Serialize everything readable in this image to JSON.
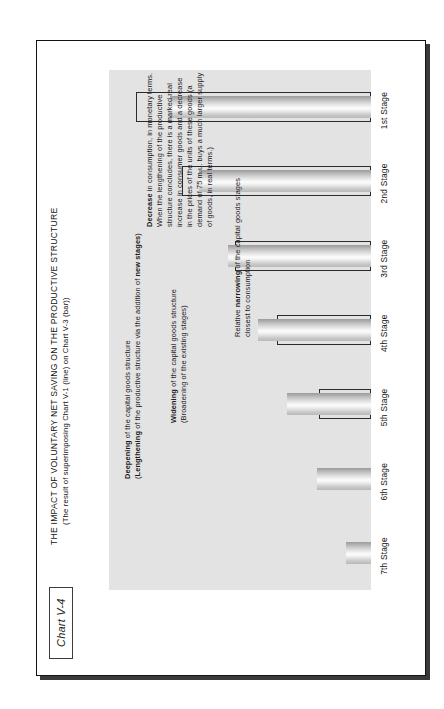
{
  "figure": {
    "tag": "Chart V-4",
    "title": "THE IMPACT OF VOLUNTARY NET SAVING ON THE PRODUCTIVE STRUCTURE",
    "subtitle": "(The result of superimposing Chart V-1 (line) on Chart V-3 (bar))"
  },
  "annotations": {
    "deepening": {
      "line1_bold": "Deepening",
      "line1_rest": " of the capital goods structure",
      "line2_pre": "(",
      "line2_bold": "Lengthening",
      "line2_mid": " of the productive structure via the addition of ",
      "line2_bold2": "new stages",
      "line2_post": ")"
    },
    "widening": {
      "line1_bold": "Widening",
      "line1_rest": " of the capital goods structure",
      "line2": "(Broadening of the existing stages)"
    },
    "narrowing": {
      "line1_pre": "Relative ",
      "line1_bold": "narrowing",
      "line1_rest": " of the capital goods stages",
      "line2": "closest to consumption"
    },
    "decrease": {
      "bold": "Decrease",
      "text": " in consumption, in monetary terms. When the lengthening of the productive structure concludes, there is a marked real increase in consumer goods and a decrease in the prices of the units of these goods (a demand of 75 m.u. buys a much larger supply of goods, in real terms.)"
    }
  },
  "chart_data": {
    "type": "bar",
    "title": "THE IMPACT OF VOLUNTARY NET SAVING ON THE PRODUCTIVE STRUCTURE",
    "subtitle": "(The result of superimposing Chart V-1 (line) on Chart V-3 (bar))",
    "xlabel": "",
    "ylabel": "",
    "grid": false,
    "legend": false,
    "categories": [
      "7th Stage",
      "6th Stage",
      "5th Stage",
      "4th Stage",
      "3rd Stage",
      "2nd Stage",
      "1st Stage"
    ],
    "series": [
      {
        "name": "Chart V-3 (bar)",
        "style": "filled-bar",
        "values": [
          12,
          26,
          40,
          54,
          68,
          82,
          96
        ]
      },
      {
        "name": "Chart V-1 (line)",
        "style": "outline-rectangle",
        "values": [
          0,
          0,
          25,
          45,
          65,
          90,
          112
        ]
      }
    ],
    "ylim": [
      0,
      125
    ],
    "units": "monetary units"
  }
}
